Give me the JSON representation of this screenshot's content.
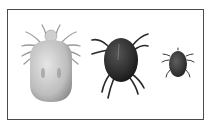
{
  "figure": {
    "items": [
      {
        "name": "pale-mite",
        "color": "#c8c8c8",
        "size": "large"
      },
      {
        "name": "dark-mite",
        "color": "#2e2e2e",
        "size": "medium"
      },
      {
        "name": "small-mite",
        "color": "#3a3a3a",
        "size": "small"
      }
    ],
    "frame_color": "#4a4a4a"
  }
}
